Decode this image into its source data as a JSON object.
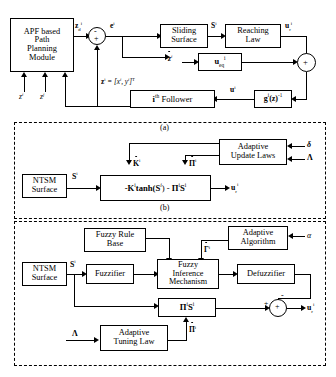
{
  "diagram": {
    "section_labels": {
      "a": "(a)",
      "b": "(b)",
      "c": "(c)"
    }
  },
  "section_a": {
    "blocks": {
      "apf": "APF based\nPath\nPlanning\nModule",
      "apf_line1": "APF based",
      "apf_line2": "Path",
      "apf_line3": "Planning",
      "apf_line4": "Module",
      "sliding_surface_line1": "Sliding",
      "sliding_surface_line2": "Surface",
      "reaching_law_line1": "Reaching",
      "reaching_law_line2": "Law",
      "u_eq": "u",
      "u_eq_sub": "eq",
      "u_eq_sup": "i",
      "follower": "Follower",
      "follower_prefix": "i",
      "follower_prefix_sup": "th",
      "g_inv": "g",
      "g_inv_sup": "i",
      "g_inv_arg": "(z)",
      "g_inv_pow": "-1"
    },
    "signals": {
      "zd": "z",
      "zd_sub": "d",
      "zd_sup": "i",
      "e": "e",
      "e_sup": "i",
      "S": "S",
      "S_sup": "i",
      "ur": "u",
      "ur_sub": "r",
      "ur_sup": "i",
      "zdot": "z",
      "zdot_sup": "i",
      "u": "u",
      "u_sup": "i",
      "state_eq": "z",
      "state_eq_sup": "i",
      "state_eq_rest": " = [x",
      "state_eq_sup2": "i",
      "state_eq_rest2": ", y",
      "state_eq_sup3": "i",
      "state_eq_rest3": "]",
      "state_eq_T": "T",
      "input_zi": "z",
      "input_zi_sup": "i",
      "input_zj": "z",
      "input_zj_sup": "j",
      "minus": "-",
      "plus": "+"
    }
  },
  "section_b": {
    "blocks": {
      "ntsm_line1": "NTSM",
      "ntsm_line2": "Surface",
      "adaptive_line1": "Adaptive",
      "adaptive_line2": "Update Laws",
      "law_K": "-K",
      "law_K_sup": "i",
      "law_tanh": "tanh(S",
      "law_tanh_sup": "i",
      "law_mid": ") - ",
      "law_Pi": "Π",
      "law_Pi_sup": "i",
      "law_S": "S",
      "law_S_sup": "i"
    },
    "signals": {
      "S": "S",
      "S_sup": "i",
      "Kdot": "K",
      "Kdot_sup": "i",
      "Pidot": "Π",
      "Pidot_sup": "i",
      "ur": "u",
      "ur_sub": "r",
      "ur_sup": "i",
      "delta": "δ",
      "lambda": "Λ"
    }
  },
  "section_c": {
    "blocks": {
      "fuzzy_rule_line1": "Fuzzy Rule",
      "fuzzy_rule_line2": "Base",
      "adaptive_alg_line1": "Adaptive",
      "adaptive_alg_line2": "Algorithm",
      "ntsm_line1": "NTSM",
      "ntsm_line2": "Surface",
      "fuzzifier": "Fuzzifier",
      "fim_line1": "Fuzzy",
      "fim_line2": "Inference",
      "fim_line3": "Mechanism",
      "defuzzifier": "Defuzzifier",
      "pi_s": "Π",
      "pi_s_sup": "i",
      "pi_s_S": "S",
      "pi_s_S_sup": "i",
      "tuning_line1": "Adaptive",
      "tuning_line2": "Tuning Law"
    },
    "signals": {
      "S": "S",
      "S_sup": "i",
      "Gamma_dot": "Γ",
      "Gamma_dot_sup": "i",
      "Pidot": "Π",
      "Pidot_sup": "i",
      "alpha": "α",
      "lambda": "Λ",
      "ur": "u",
      "ur_sub": "r",
      "ur_sup": "i",
      "plus": "+",
      "minus": "-"
    }
  },
  "colors": {
    "stroke": "#000000",
    "background": "#ffffff"
  }
}
